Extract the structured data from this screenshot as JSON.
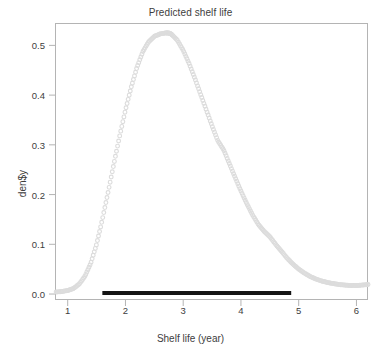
{
  "chart_data": {
    "type": "line",
    "title": "Predicted shelf life",
    "xlabel": "Shelf life (year)",
    "ylabel": "den$y",
    "xlim": [
      0.78,
      6.2
    ],
    "ylim": [
      -0.012,
      0.545
    ],
    "grid": false,
    "legend": false,
    "marker_style": "open-circle",
    "line_color": "#dcdcdc",
    "interval_color": "#141414",
    "series": [
      {
        "name": "density",
        "x": [
          0.8,
          0.9,
          1.0,
          1.1,
          1.2,
          1.3,
          1.4,
          1.5,
          1.6,
          1.7,
          1.8,
          1.9,
          2.0,
          2.1,
          2.2,
          2.3,
          2.4,
          2.5,
          2.6,
          2.7,
          2.75,
          2.8,
          2.9,
          3.0,
          3.1,
          3.2,
          3.3,
          3.4,
          3.5,
          3.6,
          3.7,
          3.8,
          3.9,
          4.0,
          4.1,
          4.2,
          4.3,
          4.4,
          4.5,
          4.6,
          4.7,
          4.8,
          4.9,
          5.0,
          5.1,
          5.2,
          5.3,
          5.4,
          5.5,
          5.6,
          5.7,
          5.8,
          5.9,
          6.0,
          6.1,
          6.2
        ],
        "y": [
          0.004,
          0.005,
          0.007,
          0.011,
          0.02,
          0.036,
          0.062,
          0.1,
          0.15,
          0.205,
          0.262,
          0.318,
          0.37,
          0.416,
          0.456,
          0.487,
          0.507,
          0.518,
          0.523,
          0.525,
          0.525,
          0.522,
          0.51,
          0.49,
          0.464,
          0.434,
          0.402,
          0.37,
          0.338,
          0.308,
          0.29,
          0.262,
          0.234,
          0.207,
          0.182,
          0.159,
          0.14,
          0.126,
          0.115,
          0.1,
          0.086,
          0.072,
          0.06,
          0.05,
          0.042,
          0.035,
          0.03,
          0.026,
          0.023,
          0.021,
          0.019,
          0.018,
          0.017,
          0.017,
          0.018,
          0.019
        ]
      }
    ],
    "xticks": [
      1,
      2,
      3,
      4,
      5,
      6
    ],
    "xtick_labels": [
      "1",
      "2",
      "3",
      "4",
      "5",
      "6"
    ],
    "yticks": [
      0.0,
      0.1,
      0.2,
      0.3,
      0.4,
      0.5
    ],
    "ytick_labels": [
      "0.0",
      "0.1",
      "0.2",
      "0.3",
      "0.4",
      "0.5"
    ],
    "annotations": [
      {
        "name": "credible-interval-bar",
        "type": "hline-segment",
        "x_start": 1.6,
        "x_end": 4.87,
        "y": 0.0,
        "color": "#141414",
        "thickness_px": 4
      }
    ],
    "peak": {
      "x": 2.75,
      "y": 0.525
    }
  }
}
